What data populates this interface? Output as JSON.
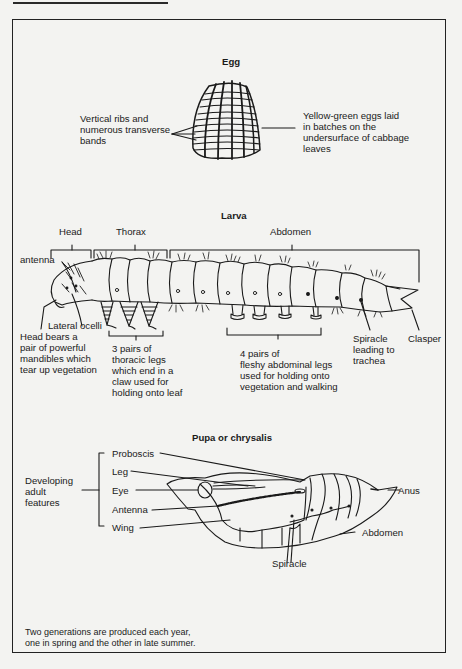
{
  "egg": {
    "title": "Egg",
    "label_left": "Vertical ribs and\nnumerous transverse\nbands",
    "label_right": "Yellow-green eggs laid\nin batches on the\nundersurface of cabbage\nleaves"
  },
  "larva": {
    "title": "Larva",
    "regions": {
      "head": "Head",
      "thorax": "Thorax",
      "abdomen": "Abdomen"
    },
    "labels": {
      "antenna": "antenna",
      "lateral_ocelli": "Lateral ocelli",
      "head_note": "Head bears a\npair of powerful\nmandibles which\ntear up vegetation",
      "thoracic_legs": "3 pairs of\nthoracic legs\nwhich end in a\nclaw used for\nholding onto leaf",
      "abdominal_legs": "4 pairs of\nfleshy abdominal legs\nused for holding onto\nvegetation and walking",
      "spiracle": "Spiracle\nleading to\ntrachea",
      "clasper": "Clasper"
    }
  },
  "pupa": {
    "title": "Pupa or chrysalis",
    "group_label": "Developing\nadult\nfeatures",
    "features": [
      "Proboscis",
      "Leg",
      "Eye",
      "Antenna",
      "Wing"
    ],
    "labels": {
      "anus": "Anus",
      "abdomen": "Abdomen",
      "spiracle": "Spiracle"
    }
  },
  "footnote": "Two generations are produced each year,\none in spring and the other in late summer."
}
